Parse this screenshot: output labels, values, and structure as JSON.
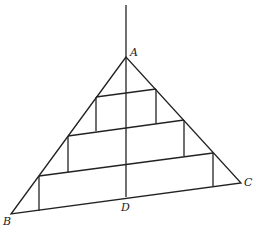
{
  "diagram": {
    "type": "geometry-figure",
    "points": {
      "A": {
        "label": "A",
        "x": 126,
        "y": 57
      },
      "B": {
        "label": "B",
        "x": 11,
        "y": 214
      },
      "C": {
        "label": "C",
        "x": 241,
        "y": 183
      },
      "D": {
        "label": "D",
        "x": 126,
        "y": 197
      }
    },
    "axis": {
      "x1": 126,
      "y1": 5,
      "x2": 126,
      "y2": 197
    },
    "steps": [
      {
        "x1": 96,
        "y1": 97,
        "x2": 156,
        "y2": 89,
        "vl_bottom": 131,
        "vr_bottom": 124
      },
      {
        "x1": 68,
        "y1": 136,
        "x2": 184,
        "y2": 120,
        "vl_bottom": 172,
        "vr_bottom": 156
      },
      {
        "x1": 39,
        "y1": 176,
        "x2": 213,
        "y2": 153,
        "vl_bottom": 211,
        "vr_bottom": 186
      }
    ],
    "stroke_color": "#222222",
    "caption": ""
  }
}
